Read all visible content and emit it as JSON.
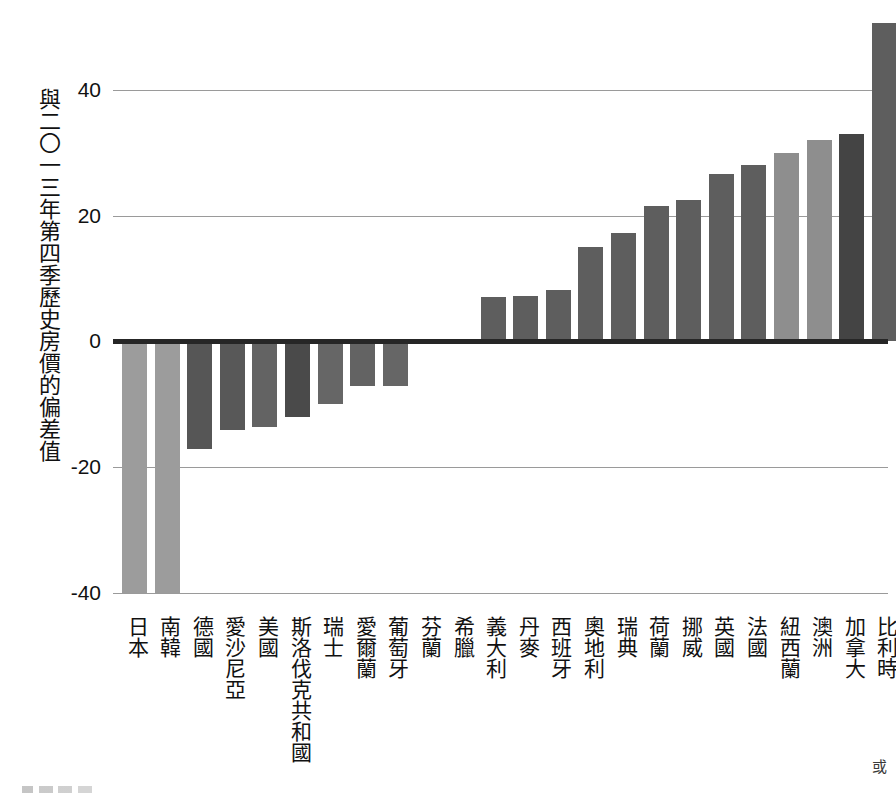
{
  "chart_data": {
    "type": "bar",
    "title": "",
    "subtitle": "",
    "xlabel": "",
    "ylabel": "與二〇一三年第四季歷史房價的偏差值",
    "ylim": [
      -42,
      52
    ],
    "yticks": [
      40,
      20,
      0,
      -20,
      -40
    ],
    "ytick_labels": [
      "40",
      "20",
      "0",
      "-20",
      "-40"
    ],
    "grid": true,
    "legend": "none",
    "categories": [
      "日本",
      "南韓",
      "德國",
      "愛沙尼亞",
      "美國",
      "斯洛伐克共和國",
      "瑞士",
      "愛爾蘭",
      "葡萄牙",
      "芬蘭",
      "希臘",
      "義大利",
      "丹麥",
      "西班牙",
      "奧地利",
      "瑞典",
      "荷蘭",
      "挪威",
      "英國",
      "法國",
      "紐西蘭",
      "澳洲",
      "加拿大",
      "比利時"
    ],
    "values": [
      -40,
      -40,
      -17,
      -14,
      -13.5,
      -12,
      -10,
      -7,
      -7,
      -0.3,
      0.4,
      7,
      7.2,
      8.2,
      15,
      17.3,
      21.5,
      22.5,
      26.6,
      28,
      30,
      32,
      33,
      50.5
    ],
    "bar_colors": [
      "#9c9c9c",
      "#9c9c9c",
      "#565656",
      "#585858",
      "#636363",
      "#4a4a4a",
      "#666666",
      "#636363",
      "#666666",
      "#5e5e5e",
      "#5e5e5e",
      "#5e5e5e",
      "#5e5e5e",
      "#5e5e5e",
      "#5e5e5e",
      "#5e5e5e",
      "#5e5e5e",
      "#5e5e5e",
      "#5e5e5e",
      "#5e5e5e",
      "#8e8e8e",
      "#8e8e8e",
      "#444444",
      "#5e5e5e"
    ],
    "axis_color": "#262626",
    "gridline_color": "#9a9a9a"
  },
  "marks": {
    "corner_glyph": "或"
  }
}
